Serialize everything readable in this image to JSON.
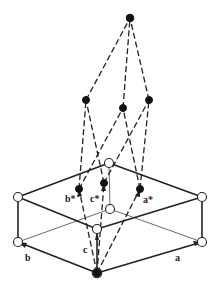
{
  "diagram": {
    "type": "reciprocal-lattice-construction",
    "labels": {
      "a": "a",
      "b": "b",
      "c": "c",
      "a_star": "a*",
      "b_star": "b*",
      "c_star": "c*"
    },
    "colors": {
      "line": "#222222",
      "background": "#ffffff",
      "open_node_fill": "#ffffff",
      "solid_node_fill": "#111111"
    },
    "unit_cell_nodes": [
      {
        "id": "top-back",
        "x": 109,
        "y": 163
      },
      {
        "id": "top-left",
        "x": 18,
        "y": 197
      },
      {
        "id": "top-right",
        "x": 202,
        "y": 197
      },
      {
        "id": "top-front",
        "x": 97,
        "y": 229
      },
      {
        "id": "bottom-back",
        "x": 110,
        "y": 209
      },
      {
        "id": "bottom-left",
        "x": 18,
        "y": 242
      },
      {
        "id": "bottom-right",
        "x": 202,
        "y": 242
      }
    ],
    "origin": {
      "x": 97,
      "y": 273
    },
    "reciprocal_nodes": [
      {
        "id": "a-star",
        "x": 140,
        "y": 189
      },
      {
        "id": "b-star",
        "x": 79,
        "y": 189
      },
      {
        "id": "c-star",
        "x": 104,
        "y": 183
      },
      {
        "id": "mid-left",
        "x": 86,
        "y": 100
      },
      {
        "id": "mid-center",
        "x": 123,
        "y": 108
      },
      {
        "id": "mid-right",
        "x": 149,
        "y": 100
      },
      {
        "id": "apex",
        "x": 130,
        "y": 18
      }
    ]
  }
}
